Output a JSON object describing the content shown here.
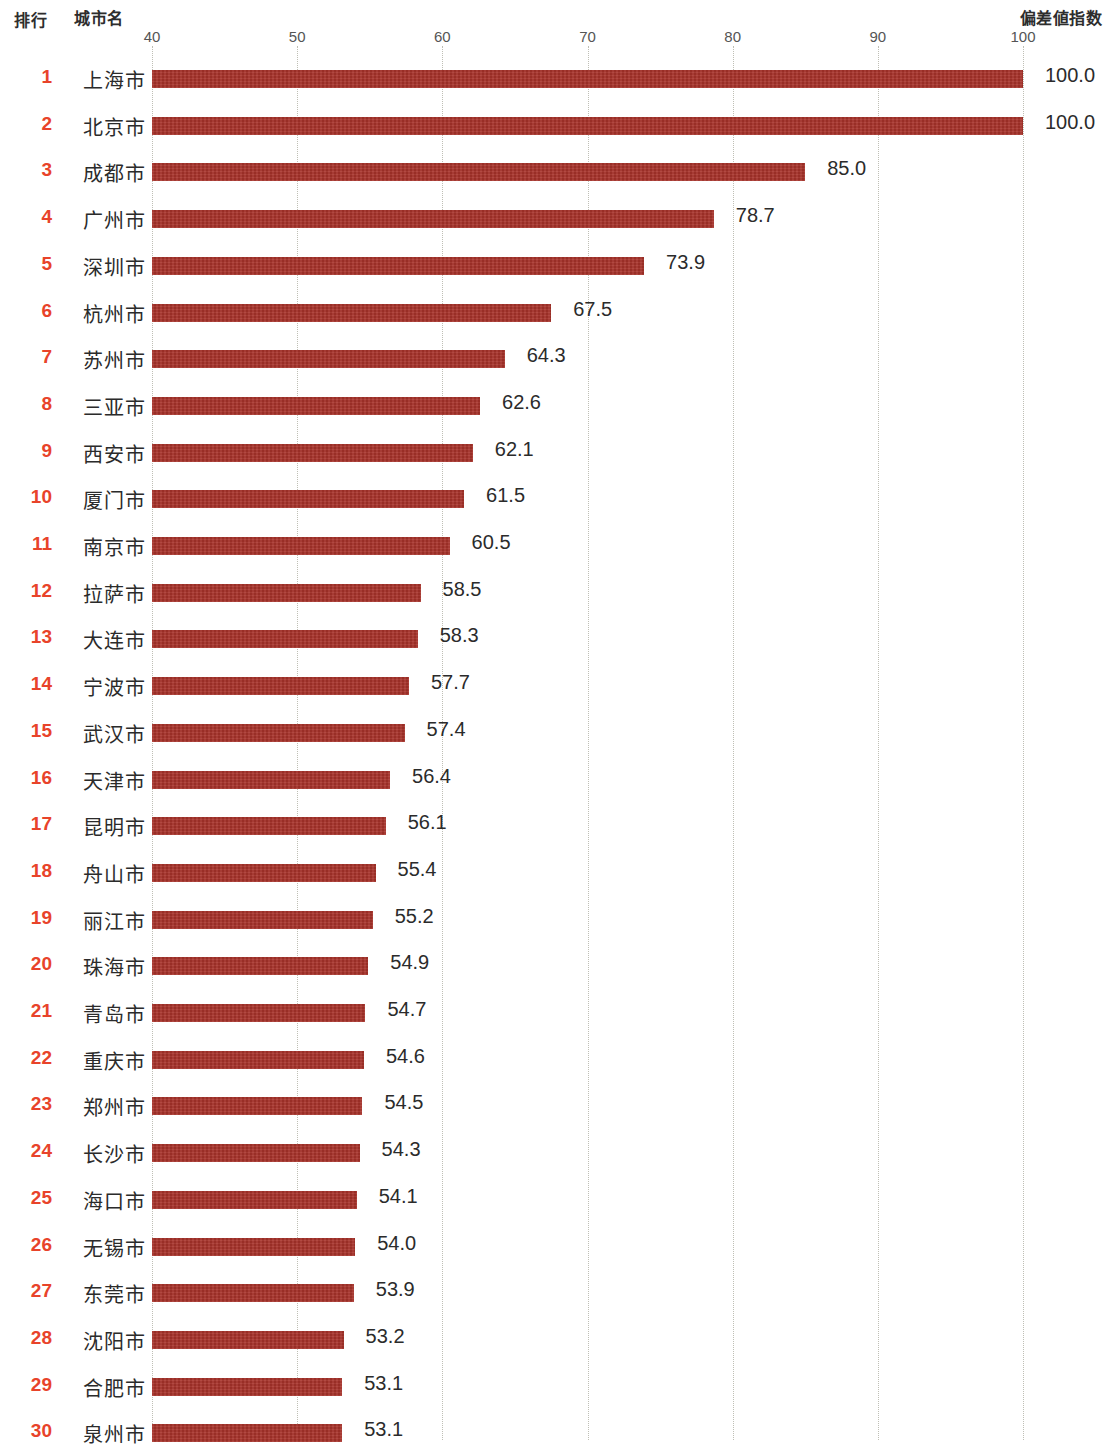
{
  "headers": {
    "rank": "排行",
    "city": "城市名",
    "index": "偏差値指数"
  },
  "colors": {
    "bar": "#a8322a",
    "rank_text": "#e8432a",
    "body_text": "#2b2b2b",
    "gridline": "#b9b9ae",
    "background": "#ffffff"
  },
  "chart_data": {
    "type": "bar",
    "orientation": "horizontal",
    "title": "",
    "xlabel": "偏差値指数",
    "ylabel": "城市名",
    "xlim": [
      40,
      100
    ],
    "ticks": [
      40,
      50,
      60,
      70,
      80,
      90,
      100
    ],
    "tick_labels": [
      "40",
      "50",
      "60",
      "70",
      "80",
      "90",
      "100"
    ],
    "grid": true,
    "legend": null,
    "categories": [
      "上海市",
      "北京市",
      "成都市",
      "广州市",
      "深圳市",
      "杭州市",
      "苏州市",
      "三亚市",
      "西安市",
      "厦门市",
      "南京市",
      "拉萨市",
      "大连市",
      "宁波市",
      "武汉市",
      "天津市",
      "昆明市",
      "舟山市",
      "丽江市",
      "珠海市",
      "青岛市",
      "重庆市",
      "郑州市",
      "长沙市",
      "海口市",
      "无锡市",
      "东莞市",
      "沈阳市",
      "合肥市",
      "泉州市"
    ],
    "values": [
      100.0,
      100.0,
      85.0,
      78.7,
      73.9,
      67.5,
      64.3,
      62.6,
      62.1,
      61.5,
      60.5,
      58.5,
      58.3,
      57.7,
      57.4,
      56.4,
      56.1,
      55.4,
      55.2,
      54.9,
      54.7,
      54.6,
      54.5,
      54.3,
      54.1,
      54.0,
      53.9,
      53.2,
      53.1,
      53.1
    ],
    "value_labels": [
      "100.0",
      "100.0",
      "85.0",
      "78.7",
      "73.9",
      "67.5",
      "64.3",
      "62.6",
      "62.1",
      "61.5",
      "60.5",
      "58.5",
      "58.3",
      "57.7",
      "57.4",
      "56.4",
      "56.1",
      "55.4",
      "55.2",
      "54.9",
      "54.7",
      "54.6",
      "54.5",
      "54.3",
      "54.1",
      "54.0",
      "53.9",
      "53.2",
      "53.1",
      "53.1"
    ],
    "ranks": [
      "1",
      "2",
      "3",
      "4",
      "5",
      "6",
      "7",
      "8",
      "9",
      "10",
      "11",
      "12",
      "13",
      "14",
      "15",
      "16",
      "17",
      "18",
      "19",
      "20",
      "21",
      "22",
      "23",
      "24",
      "25",
      "26",
      "27",
      "28",
      "29",
      "30"
    ]
  }
}
